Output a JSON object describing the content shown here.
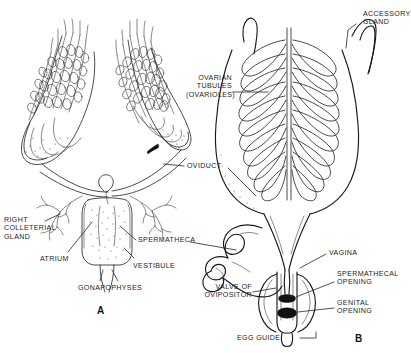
{
  "figure": {
    "panels": [
      {
        "id": "A",
        "label": "A",
        "description": "Dorsal view of female reproductive organs with paired ovaries, colleterial glands, atrium and gonapophyses"
      },
      {
        "id": "B",
        "label": "B",
        "description": "Ventral view showing ovarioles, accessory gland, oviduct, coiled spermatheca, vagina and ovipositor"
      }
    ],
    "line_color": "#2b2b2b",
    "background_color": "#ffffff",
    "text_color": "#1d1d1d"
  },
  "labels": {
    "accessory_gland": "ACCESSORY\nGLAND",
    "ovarian_tubules": "OVARIAN\nTUBULES\n(OVARIOLES)",
    "oviduct": "OVIDUCT",
    "right_colleterial_gland": "RIGHT\nCOLLETERIAL\nGLAND",
    "atrium": "ATRIUM",
    "spermatheca": "SPERMATHECA",
    "vestibule": "VESTIBULE",
    "gonapophyses": "GONAPOPHYSES",
    "vagina": "VAGINA",
    "spermathecal_opening": "SPERMATHECAL\nOPENING",
    "genital_opening": "GENITAL\nOPENING",
    "valve_of_ovipositor": "VALVE OF\nOVIPOSITOR",
    "egg_guide": "EGG GUIDE",
    "panel_a": "A",
    "panel_b": "B"
  }
}
